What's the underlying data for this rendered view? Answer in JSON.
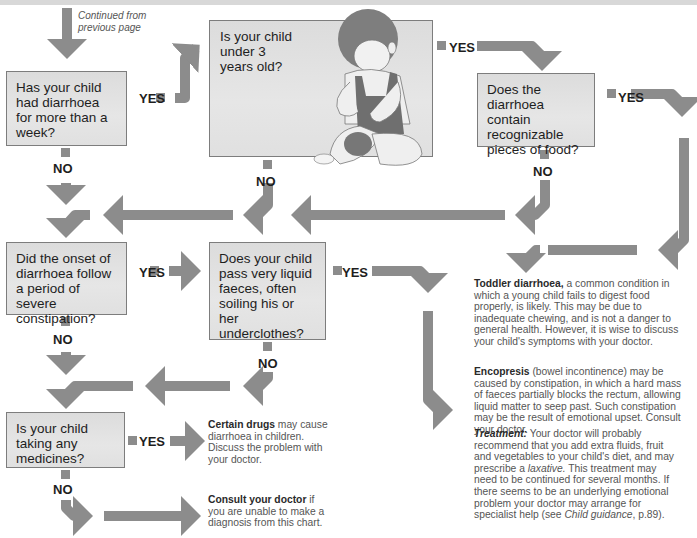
{
  "page": {
    "continued_note": "Continued from previous page",
    "colors": {
      "arrow": "#8c8c8c",
      "box_fill": "#e0e0e0",
      "box_border": "#7d7d7d",
      "text": "#1e1e1e",
      "note_text": "#555555"
    }
  },
  "questions": [
    {
      "id": "q1",
      "text": "Has your child had diarrhoea for more than a week?",
      "yes_label": "YES",
      "no_label": "NO"
    },
    {
      "id": "q2",
      "text": "Is your child under 3 years old?",
      "yes_label": "YES",
      "no_label": "NO"
    },
    {
      "id": "q3",
      "text": "Does the diarrhoea contain recognizable pieces of food?",
      "yes_label": "YES",
      "no_label": "NO"
    },
    {
      "id": "q4",
      "text": "Did the onset of diarrhoea follow a period of severe constipation?",
      "yes_label": "YES",
      "no_label": "NO"
    },
    {
      "id": "q5",
      "text": "Does your child pass very liquid faeces, often soiling his or her underclothes?",
      "yes_label": "YES",
      "no_label": "NO"
    },
    {
      "id": "q6",
      "text": "Is your child taking any medicines?",
      "yes_label": "YES",
      "no_label": "NO"
    }
  ],
  "outcomes": {
    "toddler": {
      "title": "Toddler diarrhoea,",
      "body": " a common condition in which a young child fails to digest food properly, is likely. This may be due to inadequate chewing, and is not a danger to general health. However, it is wise to discuss your child's symptoms with your doctor."
    },
    "encopresis": {
      "title": "Encopresis",
      "body": " (bowel incontinence) may be caused by constipation, in which a hard mass of faeces partially blocks the rectum, allowing liquid matter to seep past. Such constipation may be the result of emotional upset. Consult your doctor."
    },
    "treatment": {
      "title": "Treatment:",
      "body1": " Your doctor will probably recommend that you add extra fluids, fruit and vegetables to your child's diet, and may prescribe a ",
      "italic1": "laxative.",
      "body2": " This treatment may need to be continued for several months. If there seems to be an underlying emotional problem your doctor may arrange for specialist help (see ",
      "italic2": "Child guidance",
      "body3": ", p.89)."
    },
    "drugs": {
      "title": "Certain drugs",
      "body": " may cause diarrhoea in children. Discuss the problem with your doctor."
    },
    "consult": {
      "title": "Consult your doctor",
      "body": " if you are unable to make a diagnosis from this chart."
    }
  }
}
